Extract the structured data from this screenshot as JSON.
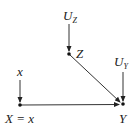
{
  "diagram": {
    "type": "causal-graph",
    "nodes": [
      {
        "id": "UZ",
        "label": "U",
        "subscript": "Z",
        "x": 69,
        "y": 18,
        "exogenous": true
      },
      {
        "id": "Z",
        "label": "Z",
        "x": 69,
        "y": 54
      },
      {
        "id": "x",
        "label": "x",
        "x": 20,
        "y": 72,
        "exogenous": true
      },
      {
        "id": "X",
        "label": "X = x",
        "x": 20,
        "y": 105
      },
      {
        "id": "UY",
        "label": "U",
        "subscript": "Y",
        "x": 122,
        "y": 62,
        "exogenous": true
      },
      {
        "id": "Y",
        "label": "Y",
        "x": 123,
        "y": 104
      }
    ],
    "edges": [
      {
        "from": "UZ",
        "to": "Z"
      },
      {
        "from": "x",
        "to": "X"
      },
      {
        "from": "Z",
        "to": "Y"
      },
      {
        "from": "UY",
        "to": "Y"
      },
      {
        "from": "X",
        "to": "Y"
      }
    ],
    "labels": {
      "uz_main": "U",
      "uz_sub": "Z",
      "z": "Z",
      "x_small": "x",
      "x_eq": "X = x",
      "uy_main": "U",
      "uy_sub": "Y",
      "y": "Y"
    },
    "colors": {
      "edge": "#333333",
      "node": "#111111",
      "text": "#222222"
    }
  }
}
